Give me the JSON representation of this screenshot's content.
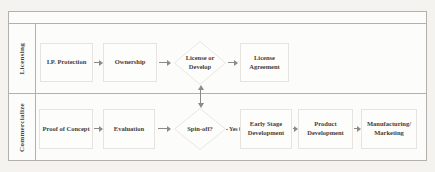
{
  "colors": {
    "page_bg": "#f4f3f0",
    "frame_bg": "#fcfcfb",
    "frame_line": "#b4b0ab",
    "node_bg": "#fdfdfc",
    "node_border": "#e7e4e0",
    "diamond_border": "#eae7e2",
    "text": "#43403c",
    "arrow": "#8e8a85"
  },
  "diagram": {
    "lanes": [
      {
        "label": "Licensing",
        "nodes": [
          {
            "type": "process",
            "label": "I.P. Protection"
          },
          {
            "type": "process",
            "label": "Ownership"
          },
          {
            "type": "decision",
            "label": "License or Develop"
          },
          {
            "type": "process",
            "label": "License Agreement"
          }
        ]
      },
      {
        "label": "Commercialize",
        "nodes": [
          {
            "type": "process",
            "label": "Proof of Concept"
          },
          {
            "type": "process",
            "label": "Evaluation"
          },
          {
            "type": "decision",
            "label": "Spin-off?"
          },
          {
            "type": "process",
            "label": "Early Stage Development"
          },
          {
            "type": "process",
            "label": "Product Development"
          },
          {
            "type": "process",
            "label": "Manufacturing/ Marketing"
          }
        ]
      }
    ],
    "edge_labels": {
      "yes": "Yes"
    }
  }
}
